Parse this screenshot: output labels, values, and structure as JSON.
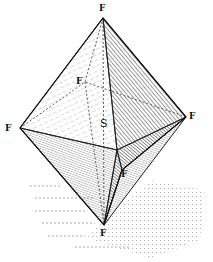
{
  "diagram": {
    "vertex_label": "F",
    "center_label": "S",
    "labels": [
      {
        "id": "top",
        "text": "F",
        "x": 99,
        "y": 4
      },
      {
        "id": "back",
        "text": "F",
        "x": 76,
        "y": 77
      },
      {
        "id": "left",
        "text": "F",
        "x": 5,
        "y": 124
      },
      {
        "id": "right",
        "text": "F",
        "x": 189,
        "y": 112
      },
      {
        "id": "front",
        "text": "F",
        "x": 121,
        "y": 170
      },
      {
        "id": "bottom",
        "text": "F",
        "x": 100,
        "y": 229
      },
      {
        "id": "center",
        "text": "S",
        "x": 100,
        "y": 118
      }
    ],
    "colors": {
      "ink": "#222222",
      "paper": "#ffffff",
      "shadow": "#777777"
    }
  }
}
